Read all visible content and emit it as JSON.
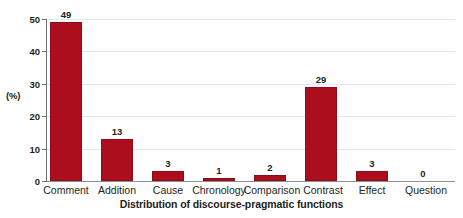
{
  "chart_data": {
    "type": "bar",
    "title": "",
    "xlabel": "Distribution of discourse-pragmatic functions",
    "ylabel": "(%)",
    "categories": [
      "Comment",
      "Addition",
      "Cause",
      "Chronology",
      "Comparison",
      "Contrast",
      "Effect",
      "Question"
    ],
    "values": [
      49,
      13,
      3,
      1,
      2,
      29,
      3,
      0
    ],
    "value_labels": [
      "49",
      "13",
      "3",
      "1",
      "2",
      "29",
      "3",
      "0"
    ],
    "ylim": [
      0,
      50
    ],
    "yticks": [
      0,
      10,
      20,
      30,
      40,
      50
    ],
    "ytick_labels": [
      "0",
      "10",
      "20",
      "30",
      "40",
      "50"
    ],
    "grid": true,
    "grid_axis": "y",
    "legend": false,
    "bar_color": "#ac0e1e",
    "gridline_color": "#dfe9ee",
    "axis_color": "#6f7174",
    "text_color": "#231f20"
  }
}
